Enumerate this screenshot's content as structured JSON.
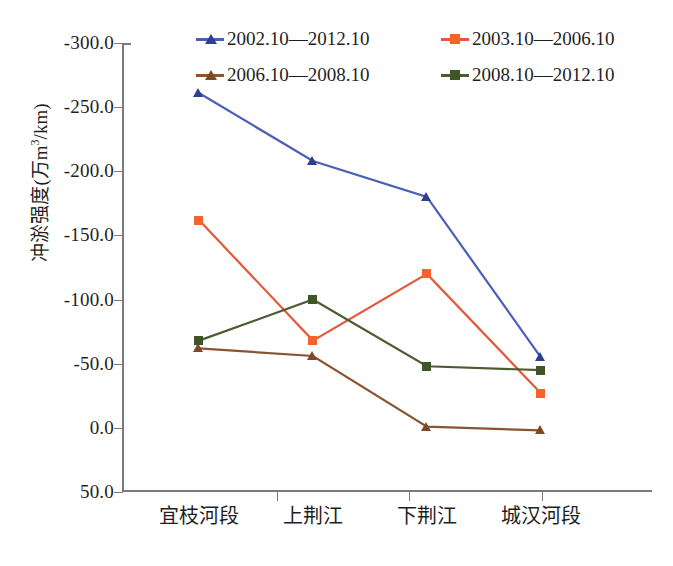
{
  "chart_data": {
    "type": "line",
    "title": "",
    "xlabel": "",
    "ylabel": "冲淤强度(万m³/km)",
    "categories": [
      "宜枝河段",
      "上荆江",
      "下荆江",
      "城汉河段"
    ],
    "yticks": [
      "-300.0",
      "-250.0",
      "-200.0",
      "-150.0",
      "-100.0",
      "-50.0",
      "0.0",
      "50.0"
    ],
    "ytick_values": [
      -300,
      -250,
      -200,
      -150,
      -100,
      -50,
      0,
      50
    ],
    "ylim": [
      -300,
      50
    ],
    "y_axis_inverted": true,
    "grid": false,
    "legend_position": "top",
    "series": [
      {
        "name": "2002.10—2012.10",
        "color": "#4a5fb5",
        "marker": "triangle",
        "marker_color": "#2f3f8f",
        "values": [
          -261,
          -208,
          -180,
          -55
        ]
      },
      {
        "name": "2003.10—2006.10",
        "color": "#e8553a",
        "marker": "square",
        "marker_color": "#f4622e",
        "values": [
          -162,
          -68,
          -120,
          -27
        ]
      },
      {
        "name": "2006.10—2008.10",
        "color": "#8a5430",
        "marker": "triangle",
        "marker_color": "#7d4a28",
        "values": [
          -62,
          -56,
          -1,
          2
        ]
      },
      {
        "name": "2008.10—2012.10",
        "color": "#4a5c32",
        "marker": "square",
        "marker_color": "#3f5427",
        "values": [
          -68,
          -100,
          -48,
          -45
        ]
      }
    ]
  },
  "axis": {
    "line_color": "#7a7a7a",
    "text_color": "#1f1f1f"
  }
}
